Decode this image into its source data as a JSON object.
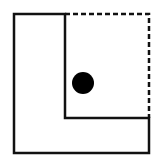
{
  "diagram": {
    "canvas": {
      "width": 158,
      "height": 162,
      "background": "#ffffff"
    },
    "stroke_color": "#111111",
    "stroke_width": 2.5,
    "outer_l_shape": {
      "points": "14,14 65,14 65,118 149,118 149,153 14,153",
      "style": "solid"
    },
    "dashed_square_edges": {
      "points": "65,14 149,14 149,118",
      "style": "dashed",
      "dash": "5,3"
    },
    "dot": {
      "cx": 83,
      "cy": 83,
      "r": 11,
      "fill": "#000000"
    }
  }
}
